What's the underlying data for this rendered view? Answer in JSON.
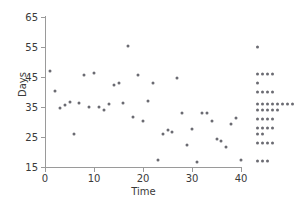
{
  "chart_data": {
    "type": "scatter",
    "title": "",
    "xlabel": "Time",
    "ylabel": "Days",
    "xlim": [
      0,
      40
    ],
    "ylim": [
      15,
      65
    ],
    "xticks": [
      0,
      10,
      20,
      30,
      40
    ],
    "yticks": [
      15,
      25,
      35,
      45,
      55,
      65
    ],
    "grid": false,
    "legend": "none",
    "point_color": "#6b6b72",
    "axis_color": "#9a9a9a",
    "x": [
      1,
      2,
      3,
      4,
      5,
      6,
      7,
      8,
      9,
      10,
      11,
      12,
      13,
      14,
      15,
      16,
      17,
      18,
      19,
      20,
      21,
      22,
      23,
      24,
      25,
      26,
      27,
      28,
      29,
      30,
      31,
      32,
      33,
      34,
      35,
      36,
      37,
      38,
      39,
      40
    ],
    "y": [
      47,
      40.5,
      34.7,
      35.8,
      36.6,
      26,
      36.4,
      45.6,
      35,
      46.5,
      35,
      34,
      36,
      42.3,
      43,
      36.2,
      55.4,
      31.6,
      45.6,
      30.4,
      37,
      43,
      17.4,
      26,
      27.4,
      26.8,
      44.8,
      33,
      22.2,
      27.6,
      16.6,
      32.9,
      33,
      30.2,
      24.2,
      23.7,
      21.8,
      29.5,
      31.2,
      17.5
    ],
    "marginal_dotplot": {
      "axis": "y",
      "position": "right",
      "bins": [
        {
          "value": 55,
          "count": 1
        },
        {
          "value": 46,
          "count": 4
        },
        {
          "value": 43,
          "count": 1
        },
        {
          "value": 40,
          "count": 4
        },
        {
          "value": 36,
          "count": 8
        },
        {
          "value": 34,
          "count": 5
        },
        {
          "value": 31,
          "count": 4
        },
        {
          "value": 28,
          "count": 4
        },
        {
          "value": 26,
          "count": 2
        },
        {
          "value": 23,
          "count": 4
        },
        {
          "value": 17,
          "count": 3
        }
      ]
    }
  }
}
